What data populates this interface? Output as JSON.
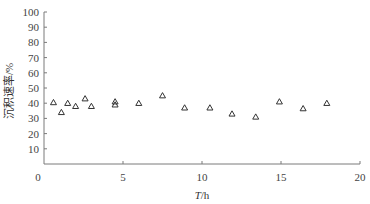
{
  "chart_data": {
    "type": "scatter",
    "title": "",
    "xlabel": "T/h",
    "xlabel_italic_part": "T",
    "xlabel_unit": "/h",
    "ylabel": "沉积速率/%",
    "xlim": [
      0,
      20
    ],
    "ylim": [
      0,
      100
    ],
    "x_ticks": [
      0,
      5,
      10,
      15,
      20
    ],
    "y_ticks": [
      10,
      20,
      30,
      40,
      50,
      60,
      70,
      80,
      90,
      100
    ],
    "origin_label": "0",
    "grid": false,
    "legend": null,
    "marker": "open-triangle",
    "series": [
      {
        "name": "沉积速率",
        "points": [
          {
            "x": 0.6,
            "y": 40.5
          },
          {
            "x": 1.1,
            "y": 34
          },
          {
            "x": 1.5,
            "y": 40
          },
          {
            "x": 2.0,
            "y": 38
          },
          {
            "x": 2.6,
            "y": 43
          },
          {
            "x": 3.0,
            "y": 38
          },
          {
            "x": 4.5,
            "y": 41
          },
          {
            "x": 4.5,
            "y": 39
          },
          {
            "x": 6.0,
            "y": 40
          },
          {
            "x": 7.5,
            "y": 45
          },
          {
            "x": 8.9,
            "y": 37
          },
          {
            "x": 10.5,
            "y": 37
          },
          {
            "x": 11.9,
            "y": 33
          },
          {
            "x": 13.4,
            "y": 31
          },
          {
            "x": 14.9,
            "y": 41
          },
          {
            "x": 16.4,
            "y": 36.5
          },
          {
            "x": 17.9,
            "y": 40
          }
        ]
      }
    ]
  },
  "colors": {
    "axis": "#7a7a7a",
    "marker": "#333333",
    "text": "#444444"
  }
}
